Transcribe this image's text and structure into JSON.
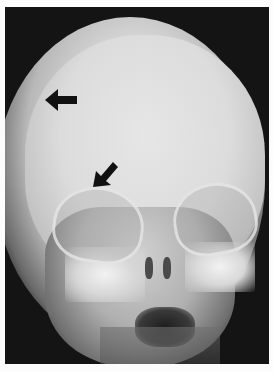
{
  "image": {
    "type": "skull radiograph (frontal view)",
    "annotations": [
      {
        "name": "arrow-left",
        "direction": "left",
        "color": "#111111"
      },
      {
        "name": "arrow-down-left",
        "direction": "down-left",
        "color": "#111111"
      }
    ],
    "colors": {
      "border": "#fcfcfc",
      "background": "#141414",
      "bone": "#e0e0e0"
    }
  }
}
